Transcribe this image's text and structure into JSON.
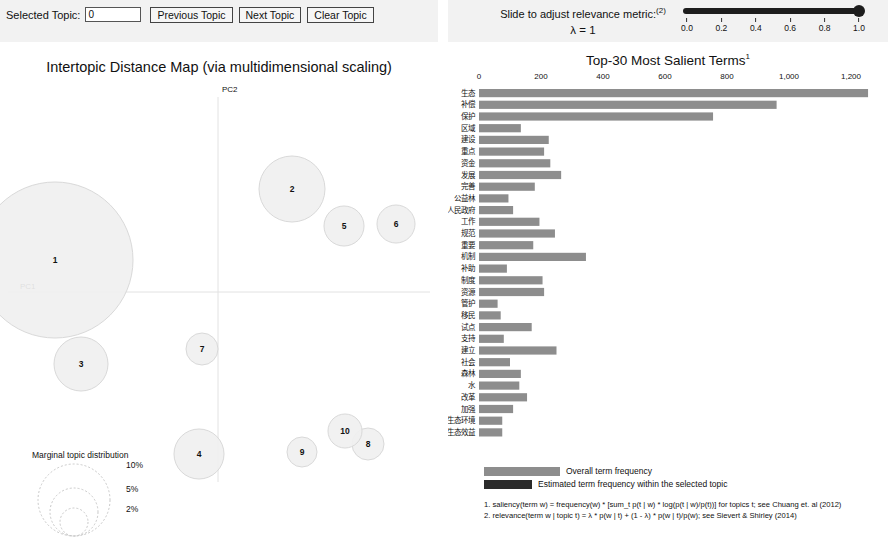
{
  "topic_control": {
    "selected_topic_label": "Selected Topic:",
    "selected_topic_value": "0",
    "previous_button": "Previous Topic",
    "next_button": "Next Topic",
    "clear_button": "Clear Topic"
  },
  "lambda_control": {
    "caption": "Slide to adjust relevance metric:",
    "caption_superscript": "(2)",
    "lambda_display": "λ = 1",
    "slider_value": 1.0,
    "ticks": [
      "0.0",
      "0.2",
      "0.4",
      "0.6",
      "0.8",
      "1.0"
    ],
    "tick_values": [
      0.0,
      0.2,
      0.4,
      0.6,
      0.8,
      1.0
    ]
  },
  "intertopic_map": {
    "title": "Intertopic Distance Map (via multidimensional scaling)",
    "x_axis_label": "PC1",
    "y_axis_label": "PC2",
    "topics": [
      {
        "id": "1",
        "cx": 55,
        "cy": 218,
        "r": 78
      },
      {
        "id": "2",
        "cx": 292,
        "cy": 147,
        "r": 33
      },
      {
        "id": "3",
        "cx": 81,
        "cy": 322,
        "r": 27
      },
      {
        "id": "4",
        "cx": 199,
        "cy": 412,
        "r": 25
      },
      {
        "id": "5",
        "cx": 344,
        "cy": 184,
        "r": 20
      },
      {
        "id": "6",
        "cx": 396,
        "cy": 182,
        "r": 19
      },
      {
        "id": "7",
        "cx": 202,
        "cy": 307,
        "r": 16
      },
      {
        "id": "8",
        "cx": 368,
        "cy": 402,
        "r": 16
      },
      {
        "id": "9",
        "cx": 302,
        "cy": 410,
        "r": 15
      },
      {
        "id": "10",
        "cx": 345,
        "cy": 389,
        "r": 17
      }
    ],
    "marginal_legend": {
      "title": "Marginal topic distribution",
      "entries": [
        {
          "label": "2%",
          "r": 14
        },
        {
          "label": "5%",
          "r": 24
        },
        {
          "label": "10%",
          "r": 36
        }
      ]
    }
  },
  "chart_data": {
    "type": "bar",
    "title": "Top-30 Most Salient Terms",
    "title_superscript": "1",
    "xlabel": "",
    "ylabel": "",
    "xlim": [
      0,
      1300
    ],
    "grid": false,
    "legend_position": "bottom",
    "tick_labels": [
      "0",
      "200",
      "400",
      "600",
      "800",
      "1,000",
      "1,200"
    ],
    "tick_values": [
      0,
      200,
      400,
      600,
      800,
      1000,
      1200
    ],
    "categories": [
      "生态",
      "补偿",
      "保护",
      "区域",
      "建设",
      "重点",
      "资金",
      "发展",
      "完善",
      "公益林",
      "人民政府",
      "工作",
      "规范",
      "重要",
      "机制",
      "补助",
      "制度",
      "资源",
      "管护",
      "移民",
      "试点",
      "支持",
      "建立",
      "社会",
      "森林",
      "水",
      "改革",
      "加强",
      "生态环境",
      "生态效益"
    ],
    "series": [
      {
        "name": "Overall term frequency",
        "values": [
          1255,
          960,
          755,
          135,
          225,
          210,
          230,
          265,
          180,
          95,
          110,
          195,
          245,
          175,
          345,
          90,
          205,
          210,
          60,
          70,
          170,
          80,
          250,
          100,
          135,
          130,
          155,
          110,
          75,
          75
        ]
      },
      {
        "name": "Estimated term frequency within the selected topic",
        "values": [
          0,
          0,
          0,
          0,
          0,
          0,
          0,
          0,
          0,
          0,
          0,
          0,
          0,
          0,
          0,
          0,
          0,
          0,
          0,
          0,
          0,
          0,
          0,
          0,
          0,
          0,
          0,
          0,
          0,
          0
        ]
      }
    ],
    "legend": [
      {
        "label": "Overall term frequency",
        "color": "#8d8d8d"
      },
      {
        "label": "Estimated term frequency within the selected topic",
        "color": "#2b2b2b"
      }
    ],
    "annotations": [
      "1. saliency(term w) = frequency(w) * [sum_t p(t | w) * log(p(t | w)/p(t))] for topics t; see Chuang et. al (2012)",
      "2. relevance(term w | topic t) = λ * p(w | t) + (1 - λ) * p(w | t)/p(w); see Sievert & Shirley (2014)"
    ]
  },
  "colors": {
    "bar_overall": "#8d8d8d",
    "bar_selected": "#2b2b2b",
    "panel_background": "#f2f2f2",
    "bubble_fill": "#f0f0f0",
    "bubble_stroke": "#d9d9d9"
  }
}
